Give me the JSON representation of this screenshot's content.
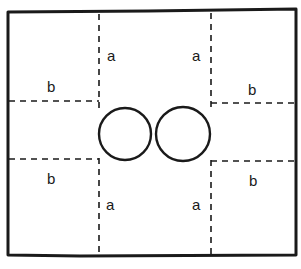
{
  "diagram": {
    "colors": {
      "stroke": "#1a1a1a",
      "background": "#ffffff"
    },
    "labels": {
      "top_left_a": "a",
      "top_right_a": "a",
      "bottom_left_a": "a",
      "bottom_right_a": "a",
      "upper_left_b": "b",
      "upper_right_b": "b",
      "lower_left_b": "b",
      "lower_right_b": "b"
    },
    "regions": [
      {
        "name": "top-left corner",
        "edges": [
          "a",
          "b"
        ]
      },
      {
        "name": "top-right corner",
        "edges": [
          "a",
          "b"
        ]
      },
      {
        "name": "bottom-left corner",
        "edges": [
          "a",
          "b"
        ]
      },
      {
        "name": "bottom-right corner",
        "edges": [
          "a",
          "b"
        ]
      }
    ],
    "center_shape": "two overlapping circles (figure-eight)"
  }
}
